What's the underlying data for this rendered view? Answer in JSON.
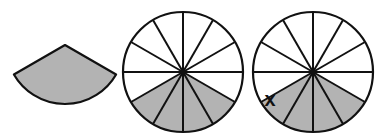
{
  "figure": {
    "background": "#ffffff",
    "shade_color": "#b3b3b3",
    "stroke_color": "#111111",
    "sector_piece": {
      "apex": [
        65,
        45
      ],
      "radius": 59,
      "angle_degrees": 120,
      "orientation": "apex-up"
    },
    "circles": [
      {
        "name": "circle-shaded",
        "center": [
          183,
          72
        ],
        "radius": 60,
        "divisions": 12,
        "shaded_sectors": 4,
        "shaded_start_deg": 30,
        "shaded_end_deg": 150,
        "label": ""
      },
      {
        "name": "circle-with-x",
        "center": [
          313,
          72
        ],
        "radius": 60,
        "divisions": 12,
        "shaded_sectors": 4,
        "shaded_start_deg": 30,
        "shaded_end_deg": 150,
        "label": "x",
        "label_pos": [
          270,
          106
        ]
      }
    ]
  }
}
